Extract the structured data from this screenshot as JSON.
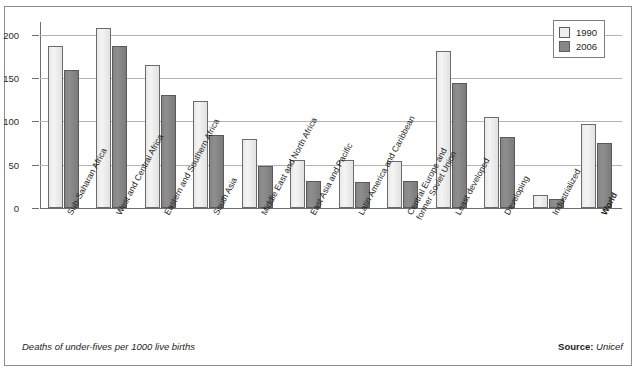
{
  "chart_data": {
    "type": "bar",
    "title": "Distribution",
    "xlabel": "",
    "ylabel": "",
    "ylim": [
      0,
      215
    ],
    "yticks": [
      0,
      50,
      100,
      150,
      200
    ],
    "grid": true,
    "legend_position": "top-right",
    "categories": [
      "Sub-Saharan Africa",
      "West and Central Africa",
      "Eastern and Southern Africa",
      "South Asia",
      "Middle East and North Africa",
      "East Asia and Pacific",
      "Latin America and Caribbean",
      "Central Europe and former Soviet Union",
      "Least developed",
      "Developing",
      "Industrialized",
      "World"
    ],
    "series": [
      {
        "name": "1990",
        "color": "#eeeeee",
        "values": [
          187,
          208,
          165,
          124,
          80,
          56,
          56,
          54,
          181,
          105,
          15,
          97
        ]
      },
      {
        "name": "2006",
        "color": "#878787",
        "values": [
          159,
          187,
          131,
          84,
          48,
          31,
          30,
          31,
          145,
          82,
          10,
          75
        ]
      }
    ],
    "caption": "Deaths of under-fives per 1000 live births",
    "source_label": "Source:",
    "source_value": "Unicef"
  },
  "axis": {
    "ytick_labels": [
      "200",
      "150",
      "100",
      "50",
      "0"
    ]
  },
  "legend": {
    "items": [
      {
        "label": "1990"
      },
      {
        "label": "2006"
      }
    ]
  },
  "categories_display": [
    {
      "line1": "Sub-Saharan Africa",
      "line2": "",
      "bold": false
    },
    {
      "line1": "West and Central Africa",
      "line2": "",
      "bold": false
    },
    {
      "line1": "Eastern and Southern Africa",
      "line2": "",
      "bold": false
    },
    {
      "line1": "South Asia",
      "line2": "",
      "bold": false
    },
    {
      "line1": "Middle East and North Africa",
      "line2": "",
      "bold": false
    },
    {
      "line1": "East Asia and Pacific",
      "line2": "",
      "bold": false
    },
    {
      "line1": "Latin America and Caribbean",
      "line2": "",
      "bold": false
    },
    {
      "line1": "Central Europe and",
      "line2": "former Soviet Union",
      "bold": false
    },
    {
      "line1": "Least developed",
      "line2": "",
      "bold": false
    },
    {
      "line1": "Developing",
      "line2": "",
      "bold": false
    },
    {
      "line1": "Industrialized",
      "line2": "",
      "bold": false
    },
    {
      "line1": "World",
      "line2": "",
      "bold": true
    }
  ]
}
